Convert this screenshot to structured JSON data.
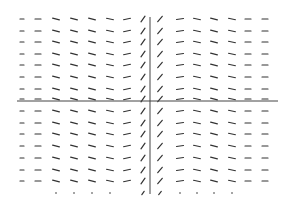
{
  "chart_data": {
    "type": "slope_field",
    "title": "",
    "xlabel": "",
    "ylabel": "",
    "grid": false,
    "legend": null,
    "axes": {
      "x_axis": {
        "y_px": 101,
        "x_start_px": 17,
        "x_end_px": 278
      },
      "y_axis": {
        "x_px": 150,
        "y_start_px": 17,
        "y_end_px": 194
      }
    },
    "columns_px": [
      22,
      38,
      56,
      74,
      92,
      110,
      127,
      143,
      160,
      180,
      197,
      214,
      232,
      248,
      265
    ],
    "column_angles_deg": [
      0,
      0,
      -15,
      -15,
      -15,
      -12,
      12,
      55,
      50,
      8,
      -12,
      -15,
      -12,
      0,
      0
    ],
    "column_lengths_px": [
      4,
      6,
      7,
      7,
      7,
      7,
      7,
      7,
      7,
      7,
      7,
      7,
      7,
      6,
      6
    ],
    "rows_px": [
      19,
      31,
      42,
      54,
      65,
      77,
      89,
      99,
      111,
      123,
      134,
      146,
      158,
      170,
      181
    ],
    "bottom_row": {
      "y_px": 193,
      "dots_columns_px": [
        56,
        74,
        92,
        110,
        180,
        197,
        214,
        232
      ],
      "short_segments": [
        {
          "x_px": 143,
          "angle_deg": 55,
          "length_px": 4
        },
        {
          "x_px": 160,
          "angle_deg": 50,
          "length_px": 4
        }
      ]
    },
    "colors": {
      "segment": "#333333",
      "axis": "#444444",
      "background": "#ffffff"
    }
  }
}
